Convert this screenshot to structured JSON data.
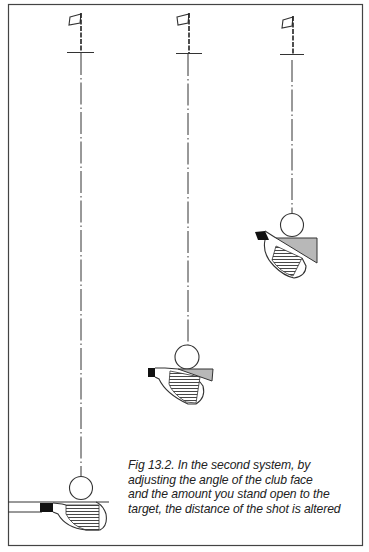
{
  "figure": {
    "label": "Fig 13.2",
    "caption_lines": [
      "Fig 13.2. In the second system, by",
      "adjusting the angle of the club face",
      "and the amount you stand open to the",
      "target, the distance of the shot is altered"
    ],
    "colors": {
      "line": "#333333",
      "face_shade": "#b8b8b8",
      "grip": "#111111",
      "background": "#ffffff"
    },
    "positions": [
      {
        "name": "square-stance",
        "flag_x": 82,
        "ball_y": 488,
        "open_angle": "none"
      },
      {
        "name": "slightly-open-stance",
        "flag_x": 189,
        "ball_y": 357,
        "open_angle": "moderate"
      },
      {
        "name": "open-stance",
        "flag_x": 293,
        "ball_y": 225,
        "open_angle": "large"
      }
    ]
  }
}
